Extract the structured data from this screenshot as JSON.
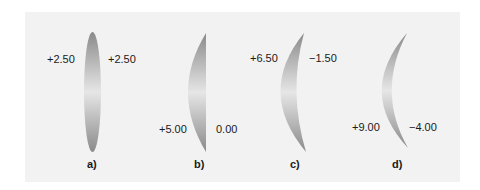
{
  "figure": {
    "lenses": [
      {
        "id": "a",
        "caption": "a)",
        "front_power": "+2.50",
        "back_power": "+2.50",
        "type": "equiconvex"
      },
      {
        "id": "b",
        "caption": "b)",
        "front_power": "+5.00",
        "back_power": "0.00",
        "type": "plano-convex"
      },
      {
        "id": "c",
        "caption": "c)",
        "front_power": "+6.50",
        "back_power": "−1.50",
        "type": "meniscus"
      },
      {
        "id": "d",
        "caption": "d)",
        "front_power": "+9.00",
        "back_power": "−4.00",
        "type": "deep meniscus"
      }
    ],
    "colors": {
      "panel_bg": "#f2f2f2",
      "lens_dark": "#8a8a8a",
      "lens_light": "#e6e6e6",
      "text": "#1a1a1a"
    }
  }
}
